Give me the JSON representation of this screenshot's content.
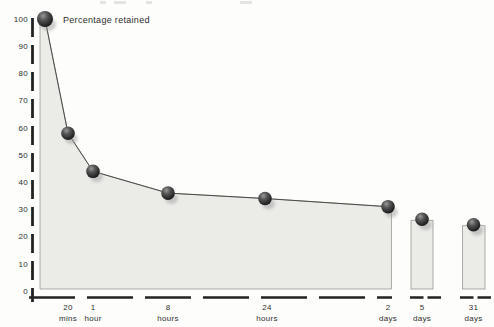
{
  "chart_data": {
    "type": "area",
    "title": "Percentage retained",
    "ylabel": "Percentage retained",
    "xlabel": "Time elapsed since learning",
    "ylim": [
      0,
      100
    ],
    "grid": false,
    "legend": false,
    "y_ticks": [
      100,
      90,
      80,
      70,
      60,
      50,
      40,
      30,
      20,
      10,
      0
    ],
    "categories": [
      "0 (immediate)",
      "20 mins",
      "1 hour",
      "8 hours",
      "24 hours",
      "2 days",
      "5 days",
      "31 days"
    ],
    "values": [
      100,
      58,
      44,
      36,
      34,
      31,
      26,
      24
    ],
    "x_tick_labels": [
      {
        "value": "20",
        "unit": "mins"
      },
      {
        "value": "1",
        "unit": "hour"
      },
      {
        "value": "8",
        "unit": "hours"
      },
      {
        "value": "24",
        "unit": "hours"
      },
      {
        "value": "2",
        "unit": "days"
      },
      {
        "value": "5",
        "unit": "days"
      },
      {
        "value": "31",
        "unit": "days"
      }
    ]
  },
  "colors": {
    "background": "#fdfdfc",
    "area_fill": "#ebebe8",
    "area_outline": "#9a9a92",
    "curve": "#4a4a46",
    "axis": "#232323",
    "text": "#2e2e2c",
    "point_highlight": "#999999",
    "point_dark": "#0c0c0c",
    "point_shadow": "#9c9c9c"
  }
}
